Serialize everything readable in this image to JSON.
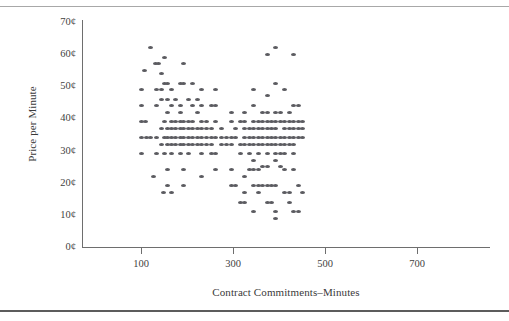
{
  "page": {
    "clipped_caption": "",
    "rules": {
      "top": "#a8a8a8",
      "bottom": "#5c5c5c"
    }
  },
  "chart_data": {
    "type": "scatter",
    "title": "",
    "xlabel": "Contract Commitments–Minutes",
    "ylabel": "Price per Minute",
    "xlim": [
      0,
      740
    ],
    "ylim": [
      0,
      72
    ],
    "grid": false,
    "legend": null,
    "marker_color": "#5b5b60",
    "axis_color": "#6e6e6e",
    "xticks": [
      100,
      300,
      500,
      700
    ],
    "xtick_labels": [
      "100",
      "300",
      "500",
      "700"
    ],
    "yticks": [
      0,
      10,
      20,
      30,
      40,
      50,
      60,
      70
    ],
    "ytick_labels": [
      "0¢",
      "10¢",
      "20¢",
      "30¢",
      "40¢",
      "50¢",
      "60¢",
      "70¢"
    ],
    "points": [
      [
        108,
        55
      ],
      [
        120,
        62
      ],
      [
        127,
        22
      ],
      [
        100,
        49
      ],
      [
        100,
        44
      ],
      [
        100,
        39
      ],
      [
        100,
        34
      ],
      [
        100,
        29
      ],
      [
        109,
        39
      ],
      [
        113,
        34
      ],
      [
        120,
        34
      ],
      [
        131,
        57
      ],
      [
        139,
        57
      ],
      [
        133,
        49
      ],
      [
        133,
        44
      ],
      [
        133,
        34
      ],
      [
        133,
        29
      ],
      [
        145,
        54
      ],
      [
        145,
        49
      ],
      [
        145,
        46
      ],
      [
        145,
        37
      ],
      [
        145,
        32
      ],
      [
        148,
        17
      ],
      [
        152,
        59
      ],
      [
        152,
        51
      ],
      [
        152,
        39
      ],
      [
        152,
        34
      ],
      [
        152,
        29
      ],
      [
        158,
        51
      ],
      [
        158,
        46
      ],
      [
        158,
        42
      ],
      [
        158,
        37
      ],
      [
        158,
        34
      ],
      [
        158,
        32
      ],
      [
        158,
        24
      ],
      [
        158,
        19
      ],
      [
        166,
        49
      ],
      [
        166,
        44
      ],
      [
        166,
        39
      ],
      [
        166,
        37
      ],
      [
        166,
        34
      ],
      [
        166,
        32
      ],
      [
        166,
        29
      ],
      [
        166,
        17
      ],
      [
        176,
        46
      ],
      [
        176,
        39
      ],
      [
        176,
        37
      ],
      [
        176,
        34
      ],
      [
        176,
        32
      ],
      [
        185,
        51
      ],
      [
        185,
        44
      ],
      [
        185,
        42
      ],
      [
        185,
        39
      ],
      [
        185,
        37
      ],
      [
        185,
        34
      ],
      [
        185,
        32
      ],
      [
        185,
        29
      ],
      [
        193,
        57
      ],
      [
        193,
        51
      ],
      [
        193,
        39
      ],
      [
        193,
        37
      ],
      [
        193,
        34
      ],
      [
        193,
        32
      ],
      [
        193,
        24
      ],
      [
        193,
        19
      ],
      [
        203,
        46
      ],
      [
        203,
        39
      ],
      [
        203,
        37
      ],
      [
        203,
        34
      ],
      [
        203,
        32
      ],
      [
        203,
        29
      ],
      [
        212,
        51
      ],
      [
        212,
        44
      ],
      [
        212,
        39
      ],
      [
        212,
        37
      ],
      [
        212,
        34
      ],
      [
        212,
        32
      ],
      [
        222,
        46
      ],
      [
        222,
        42
      ],
      [
        222,
        37
      ],
      [
        222,
        34
      ],
      [
        222,
        32
      ],
      [
        232,
        49
      ],
      [
        232,
        44
      ],
      [
        232,
        39
      ],
      [
        232,
        37
      ],
      [
        232,
        34
      ],
      [
        232,
        32
      ],
      [
        232,
        29
      ],
      [
        232,
        22
      ],
      [
        243,
        39
      ],
      [
        243,
        37
      ],
      [
        243,
        34
      ],
      [
        243,
        32
      ],
      [
        253,
        44
      ],
      [
        253,
        37
      ],
      [
        253,
        34
      ],
      [
        253,
        32
      ],
      [
        253,
        29
      ],
      [
        262,
        49
      ],
      [
        262,
        44
      ],
      [
        262,
        39
      ],
      [
        262,
        34
      ],
      [
        262,
        29
      ],
      [
        262,
        24
      ],
      [
        275,
        37
      ],
      [
        275,
        34
      ],
      [
        275,
        32
      ],
      [
        286,
        34
      ],
      [
        286,
        32
      ],
      [
        296,
        42
      ],
      [
        296,
        39
      ],
      [
        296,
        34
      ],
      [
        296,
        32
      ],
      [
        296,
        24
      ],
      [
        296,
        19
      ],
      [
        306,
        37
      ],
      [
        306,
        34
      ],
      [
        306,
        19
      ],
      [
        316,
        39
      ],
      [
        316,
        32
      ],
      [
        316,
        29
      ],
      [
        316,
        14
      ],
      [
        325,
        42
      ],
      [
        325,
        39
      ],
      [
        325,
        37
      ],
      [
        325,
        34
      ],
      [
        325,
        32
      ],
      [
        325,
        22
      ],
      [
        325,
        17
      ],
      [
        325,
        14
      ],
      [
        336,
        37
      ],
      [
        336,
        34
      ],
      [
        336,
        32
      ],
      [
        336,
        29
      ],
      [
        336,
        24
      ],
      [
        345,
        49
      ],
      [
        345,
        44
      ],
      [
        345,
        39
      ],
      [
        345,
        37
      ],
      [
        345,
        34
      ],
      [
        345,
        32
      ],
      [
        345,
        27
      ],
      [
        345,
        24
      ],
      [
        345,
        19
      ],
      [
        345,
        11
      ],
      [
        355,
        39
      ],
      [
        355,
        37
      ],
      [
        355,
        34
      ],
      [
        355,
        32
      ],
      [
        355,
        29
      ],
      [
        355,
        24
      ],
      [
        355,
        19
      ],
      [
        355,
        17
      ],
      [
        365,
        42
      ],
      [
        365,
        39
      ],
      [
        365,
        37
      ],
      [
        365,
        34
      ],
      [
        365,
        32
      ],
      [
        365,
        25
      ],
      [
        365,
        19
      ],
      [
        374,
        60
      ],
      [
        374,
        47
      ],
      [
        374,
        42
      ],
      [
        374,
        39
      ],
      [
        374,
        37
      ],
      [
        374,
        34
      ],
      [
        374,
        32
      ],
      [
        374,
        29
      ],
      [
        374,
        25
      ],
      [
        374,
        19
      ],
      [
        374,
        14
      ],
      [
        384,
        39
      ],
      [
        384,
        37
      ],
      [
        384,
        34
      ],
      [
        384,
        32
      ],
      [
        384,
        19
      ],
      [
        384,
        14
      ],
      [
        393,
        62
      ],
      [
        393,
        51
      ],
      [
        393,
        42
      ],
      [
        393,
        39
      ],
      [
        393,
        37
      ],
      [
        393,
        34
      ],
      [
        393,
        32
      ],
      [
        393,
        29
      ],
      [
        393,
        27
      ],
      [
        393,
        19
      ],
      [
        393,
        11
      ],
      [
        393,
        9
      ],
      [
        403,
        42
      ],
      [
        403,
        39
      ],
      [
        403,
        34
      ],
      [
        403,
        32
      ],
      [
        403,
        29
      ],
      [
        403,
        25
      ],
      [
        412,
        49
      ],
      [
        412,
        39
      ],
      [
        412,
        37
      ],
      [
        412,
        34
      ],
      [
        412,
        32
      ],
      [
        412,
        29
      ],
      [
        412,
        24
      ],
      [
        412,
        17
      ],
      [
        422,
        42
      ],
      [
        422,
        39
      ],
      [
        422,
        37
      ],
      [
        422,
        34
      ],
      [
        422,
        32
      ],
      [
        422,
        17
      ],
      [
        422,
        14
      ],
      [
        432,
        60
      ],
      [
        432,
        44
      ],
      [
        432,
        39
      ],
      [
        432,
        37
      ],
      [
        432,
        34
      ],
      [
        432,
        32
      ],
      [
        432,
        29
      ],
      [
        432,
        24
      ],
      [
        432,
        11
      ],
      [
        442,
        44
      ],
      [
        442,
        39
      ],
      [
        442,
        37
      ],
      [
        442,
        34
      ],
      [
        442,
        19
      ],
      [
        442,
        11
      ],
      [
        452,
        39
      ],
      [
        452,
        37
      ],
      [
        452,
        34
      ],
      [
        452,
        17
      ]
    ]
  }
}
